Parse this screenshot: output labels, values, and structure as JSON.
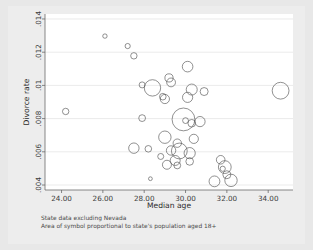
{
  "figure": {
    "background_color": "#e8e8e8",
    "plot_background_color": "#ffffff",
    "bubble_stroke_color": "#555555",
    "gridline_color": "#d6d6d6",
    "axis_color": "#6a6a6a"
  },
  "caption": {
    "line1": "State data excluding Nevada",
    "line2": "Area of symbol proportional to state's population aged 18+"
  },
  "chart_data": {
    "type": "scatter",
    "title": "",
    "xlabel": "Median age",
    "ylabel": "Divorce rate",
    "xlim": [
      23.2,
      35.2
    ],
    "ylim": [
      0.0037,
      0.0143
    ],
    "xticks": [
      24.0,
      26.0,
      28.0,
      30.0,
      32.0,
      34.0
    ],
    "xtick_labels": [
      "24.00",
      "26.00",
      "28.00",
      "30.00",
      "32.00",
      "34.00"
    ],
    "yticks": [
      0.004,
      0.006,
      0.008,
      0.01,
      0.012,
      0.014
    ],
    "ytick_labels": [
      ".004",
      ".006",
      ".008",
      ".01",
      ".012",
      ".014"
    ],
    "grid": true,
    "grid_axis": "y",
    "legend": "none",
    "size_encoding": "Area of symbol proportional to state's population aged 18+",
    "x_name": "median_age",
    "y_name": "divorce_rate",
    "size_name": "population_18plus",
    "points": [
      {
        "x": 24.2,
        "y": 0.00843,
        "r": 3.2
      },
      {
        "x": 26.1,
        "y": 0.01297,
        "r": 2.2
      },
      {
        "x": 27.2,
        "y": 0.01237,
        "r": 2.6
      },
      {
        "x": 27.5,
        "y": 0.01178,
        "r": 3.2
      },
      {
        "x": 30.1,
        "y": 0.01113,
        "r": 5.3
      },
      {
        "x": 29.2,
        "y": 0.01045,
        "r": 4.1
      },
      {
        "x": 29.3,
        "y": 0.01018,
        "r": 4.4
      },
      {
        "x": 27.9,
        "y": 0.01003,
        "r": 3.0
      },
      {
        "x": 28.4,
        "y": 0.00985,
        "r": 8.2
      },
      {
        "x": 30.3,
        "y": 0.00975,
        "r": 5.5
      },
      {
        "x": 34.6,
        "y": 0.00968,
        "r": 8.4
      },
      {
        "x": 30.9,
        "y": 0.00963,
        "r": 4.0
      },
      {
        "x": 28.9,
        "y": 0.00932,
        "r": 3.3
      },
      {
        "x": 30.1,
        "y": 0.00928,
        "r": 5.1
      },
      {
        "x": 29.0,
        "y": 0.00918,
        "r": 4.6
      },
      {
        "x": 27.9,
        "y": 0.00803,
        "r": 3.4
      },
      {
        "x": 29.9,
        "y": 0.00795,
        "r": 11.4
      },
      {
        "x": 30.7,
        "y": 0.00782,
        "r": 5.1
      },
      {
        "x": 30.0,
        "y": 0.00788,
        "r": 2.9
      },
      {
        "x": 30.3,
        "y": 0.00772,
        "r": 3.8
      },
      {
        "x": 29.0,
        "y": 0.00688,
        "r": 6.2
      },
      {
        "x": 30.4,
        "y": 0.00678,
        "r": 4.6
      },
      {
        "x": 29.6,
        "y": 0.00652,
        "r": 4.2
      },
      {
        "x": 27.5,
        "y": 0.00622,
        "r": 5.2
      },
      {
        "x": 28.2,
        "y": 0.00618,
        "r": 3.3
      },
      {
        "x": 29.7,
        "y": 0.00605,
        "r": 7.9
      },
      {
        "x": 29.3,
        "y": 0.00608,
        "r": 4.7
      },
      {
        "x": 30.2,
        "y": 0.00592,
        "r": 5.6
      },
      {
        "x": 28.8,
        "y": 0.00572,
        "r": 3.0
      },
      {
        "x": 29.5,
        "y": 0.00548,
        "r": 5.0
      },
      {
        "x": 30.2,
        "y": 0.00542,
        "r": 3.8
      },
      {
        "x": 29.1,
        "y": 0.00522,
        "r": 4.5
      },
      {
        "x": 29.6,
        "y": 0.00518,
        "r": 3.4
      },
      {
        "x": 31.7,
        "y": 0.00552,
        "r": 4.3
      },
      {
        "x": 31.9,
        "y": 0.00508,
        "r": 6.4
      },
      {
        "x": 31.8,
        "y": 0.00498,
        "r": 2.6
      },
      {
        "x": 28.3,
        "y": 0.00438,
        "r": 1.9
      },
      {
        "x": 31.4,
        "y": 0.00422,
        "r": 5.4
      },
      {
        "x": 32.2,
        "y": 0.00428,
        "r": 6.2
      },
      {
        "x": 32.0,
        "y": 0.00462,
        "r": 4.0
      }
    ]
  }
}
